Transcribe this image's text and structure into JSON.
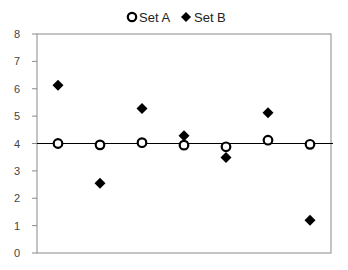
{
  "chart_data": {
    "type": "scatter",
    "title": "",
    "xlabel": "",
    "ylabel": "",
    "categories": [
      1,
      2,
      3,
      4,
      5,
      6,
      7
    ],
    "ylim": [
      0,
      8
    ],
    "yticks": [
      0,
      1,
      2,
      3,
      4,
      5,
      6,
      7,
      8
    ],
    "grid": false,
    "reference_line": {
      "y": 4,
      "color": "#000000"
    },
    "legend": {
      "position": "top",
      "entries": [
        "Set A",
        "Set B"
      ]
    },
    "series": [
      {
        "name": "Set A",
        "marker": "circle-open",
        "color": "#000000",
        "values": [
          4.0,
          3.95,
          4.03,
          3.94,
          3.88,
          4.12,
          3.97
        ]
      },
      {
        "name": "Set B",
        "marker": "diamond-filled",
        "color": "#000000",
        "values": [
          6.13,
          2.55,
          5.28,
          4.28,
          3.49,
          5.12,
          1.2
        ]
      }
    ]
  },
  "legend": {
    "set_a": "Set A",
    "set_b": "Set B"
  },
  "colors": {
    "axis": "#8a8a8a",
    "frame": "#8a8a8a",
    "marker": "#000000",
    "tick_text": "#444444"
  }
}
